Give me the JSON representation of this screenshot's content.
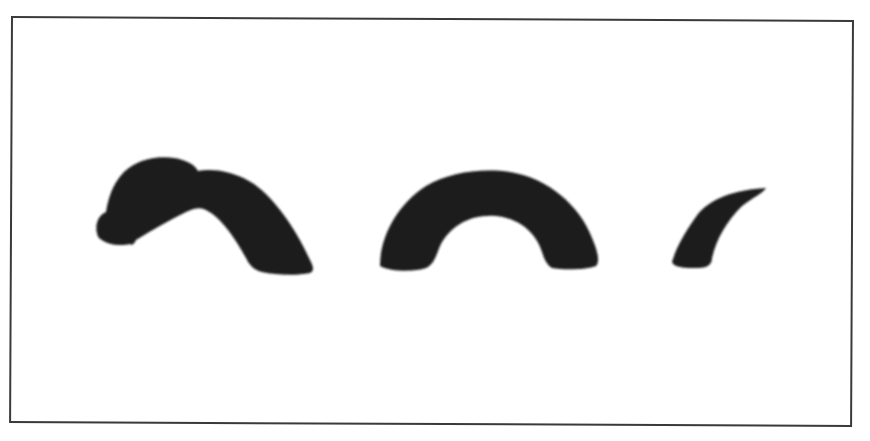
{
  "illustration": {
    "subject": "sea-serpent silhouette (Loch Ness monster style)",
    "parts": [
      {
        "name": "head-and-neck-hump"
      },
      {
        "name": "middle-hump"
      },
      {
        "name": "tail-tip"
      }
    ],
    "colors": {
      "silhouette": "#1a1a1a",
      "background": "#ffffff",
      "frame_border": "#3a3a3a"
    }
  }
}
